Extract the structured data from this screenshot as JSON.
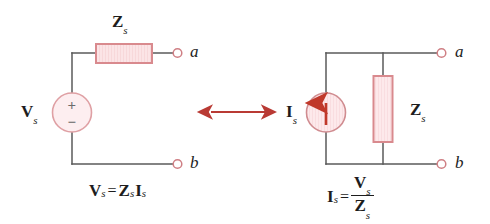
{
  "figure": {
    "title_text": "",
    "background_color": "#ffffff",
    "wire_color": "#5a5a5a",
    "component_stroke_color": "#d98a8e",
    "component_fill_color": "#fbe4e6",
    "accent_color": "#c0392b",
    "arrow_color": "#b93a34",
    "text_color": "#1d1d1d"
  },
  "left_circuit": {
    "name": "thevenin-equivalent",
    "impedance": {
      "label_main": "Z",
      "label_sub": "s",
      "orientation": "horizontal"
    },
    "source": {
      "type": "voltage-source",
      "label_main": "V",
      "label_sub": "s",
      "plus_sign": "+",
      "minus_sign": "−"
    },
    "terminals": [
      {
        "id": "a",
        "label": "a"
      },
      {
        "id": "b",
        "label": "b"
      }
    ],
    "equation": {
      "lhs_main": "V",
      "lhs_sub": "s",
      "operator": "=",
      "rhs_first_main": "Z",
      "rhs_first_sub": "s",
      "rhs_second_main": "I",
      "rhs_second_sub": "s",
      "plain": "Vs = Zs Is"
    }
  },
  "transform_arrow": {
    "name": "equivalence-arrow",
    "direction": "double-headed-horizontal",
    "symbol": "↔"
  },
  "right_circuit": {
    "name": "norton-equivalent",
    "impedance": {
      "label_main": "Z",
      "label_sub": "s",
      "orientation": "vertical"
    },
    "source": {
      "type": "current-source",
      "label_main": "I",
      "label_sub": "s",
      "arrow_direction": "up"
    },
    "terminals": [
      {
        "id": "a",
        "label": "a"
      },
      {
        "id": "b",
        "label": "b"
      }
    ],
    "equation": {
      "lhs_main": "I",
      "lhs_sub": "s",
      "operator": "=",
      "numerator_main": "V",
      "numerator_sub": "s",
      "denominator_main": "Z",
      "denominator_sub": "s",
      "plain": "Is = Vs / Zs"
    }
  }
}
